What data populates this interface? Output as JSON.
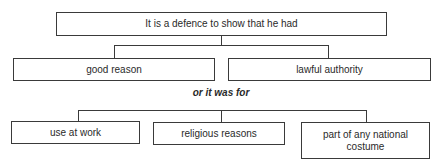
{
  "diagram": {
    "root": {
      "label": "It is a defence to show that he had"
    },
    "level1": [
      {
        "label": "good reason"
      },
      {
        "label": "lawful authority"
      }
    ],
    "separator": {
      "label": "or it was for"
    },
    "level2": [
      {
        "label": "use at work"
      },
      {
        "label": "religious reasons"
      },
      {
        "label": "part of any national costume"
      }
    ]
  },
  "colors": {
    "line": "#3a3a3a",
    "text": "#2a2a2a",
    "background": "#ffffff"
  }
}
